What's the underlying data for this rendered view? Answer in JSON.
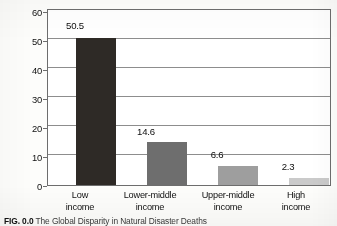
{
  "chart_data": {
    "type": "bar",
    "title": "",
    "xlabel": "",
    "ylabel": "Average annual number of deaths per million population",
    "ylabel_line1": "Average annual number of",
    "ylabel_line2": "deaths per million population",
    "categories": [
      "Low income",
      "Lower-middle income",
      "Upper-middle income",
      "High income"
    ],
    "category_lines": [
      [
        "Low",
        "income"
      ],
      [
        "Lower-middle",
        "income"
      ],
      [
        "Upper-middle",
        "income"
      ],
      [
        "High",
        "income"
      ]
    ],
    "values": [
      50.5,
      14.6,
      6.6,
      2.3
    ],
    "value_labels": [
      "50.5",
      "14.6",
      "6.6",
      "2.3"
    ],
    "ylim": [
      0,
      60
    ],
    "ytick_labels": [
      "0",
      "10",
      "20",
      "30",
      "40",
      "50",
      "60"
    ],
    "ytick_values": [
      0,
      10,
      20,
      30,
      40,
      50,
      60
    ],
    "grid": true,
    "legend": "none",
    "bar_colors": [
      "#2e2a26",
      "#6e6e6e",
      "#9e9e9e",
      "#cacaca"
    ],
    "axis_color": "#6d6d6d",
    "grid_color": "#8d8d8d",
    "plot_background": "#ffffff"
  },
  "caption": {
    "figure_number": "FIG. 0.0",
    "text": "The Global Disparity in Natural Disaster Deaths"
  }
}
